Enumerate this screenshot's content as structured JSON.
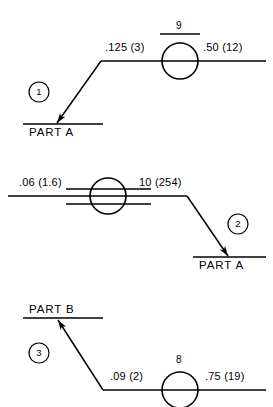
{
  "drawing": {
    "title": "Welding symbol examples",
    "stroke_color": "#000000",
    "background_color": "#ffffff"
  },
  "symbols": [
    {
      "badge": "1",
      "part_label": "PART A",
      "left_dimension": ".125 (3)",
      "right_dimension": ".50 (12)",
      "weld_size": "9",
      "weld_size_underlined": true,
      "weld_symbol": "circle",
      "reference_lines": 1,
      "arrow_direction": "down-left",
      "part_label_position": "below-line"
    },
    {
      "badge": "2",
      "part_label": "PART A",
      "left_dimension": ".06 (1.6)",
      "right_dimension": "10 (254)",
      "weld_size": "",
      "weld_size_underlined": false,
      "weld_symbol": "circle",
      "reference_lines": 3,
      "arrow_direction": "down-right",
      "part_label_position": "below-line"
    },
    {
      "badge": "3",
      "part_label": "PART B",
      "left_dimension": ".09 (2)",
      "right_dimension": ".75 (19)",
      "weld_size": "8",
      "weld_size_underlined": false,
      "weld_symbol": "circle",
      "reference_lines": 1,
      "arrow_direction": "up-left",
      "part_label_position": "above-line"
    }
  ]
}
